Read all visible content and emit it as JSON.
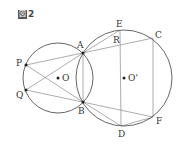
{
  "caption": {
    "prefix": "図",
    "number": "2"
  },
  "colors": {
    "circle": "#555555",
    "line": "#8a8a8a",
    "point": "#222222",
    "label": "#333333"
  },
  "circles": [
    {
      "name": "circle-O",
      "cx": 58,
      "cy": 78,
      "r": 35
    },
    {
      "name": "circle-O-prime",
      "cx": 124,
      "cy": 78,
      "r": 48
    }
  ],
  "points": {
    "A": {
      "x": 83,
      "y": 53,
      "label": "A",
      "lx": 77,
      "ly": 48
    },
    "B": {
      "x": 83,
      "y": 102,
      "label": "B",
      "lx": 78,
      "ly": 114
    },
    "P": {
      "x": 26,
      "y": 65,
      "label": "P",
      "lx": 16,
      "ly": 66
    },
    "Q": {
      "x": 26,
      "y": 90,
      "label": "Q",
      "lx": 16,
      "ly": 98
    },
    "O": {
      "x": 58,
      "y": 78,
      "label": "O",
      "lx": 62,
      "ly": 81
    },
    "O_prime": {
      "x": 124,
      "y": 78,
      "label": "O'",
      "lx": 128,
      "ly": 81
    },
    "E": {
      "x": 120,
      "y": 30,
      "label": "E",
      "lx": 116,
      "ly": 27
    },
    "R": {
      "x": 120,
      "y": 44,
      "label": "R",
      "lx": 113,
      "ly": 43
    },
    "C": {
      "x": 153,
      "y": 38,
      "label": "C",
      "lx": 155,
      "ly": 38
    },
    "D": {
      "x": 121,
      "y": 126,
      "label": "D",
      "lx": 118,
      "ly": 137
    },
    "F": {
      "x": 153,
      "y": 117,
      "label": "F",
      "lx": 156,
      "ly": 124
    }
  },
  "segments": [
    [
      "P",
      "C"
    ],
    [
      "P",
      "B"
    ],
    [
      "Q",
      "A"
    ],
    [
      "Q",
      "F"
    ],
    [
      "A",
      "B"
    ],
    [
      "A",
      "E"
    ],
    [
      "E",
      "D"
    ],
    [
      "C",
      "F"
    ],
    [
      "B",
      "D"
    ],
    [
      "D",
      "F"
    ]
  ]
}
